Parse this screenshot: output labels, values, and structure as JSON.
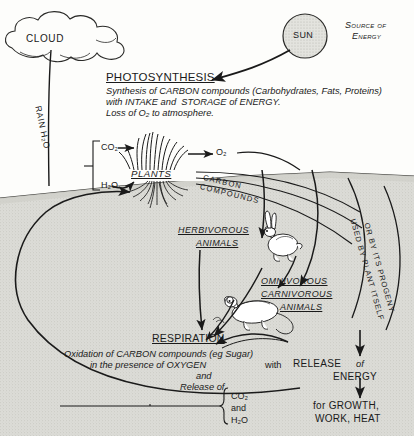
{
  "diagram": {
    "title_hidden_top": "",
    "background_color": "#fdfdfb",
    "ground_color": "#d9d9d4",
    "ink_color": "#1a1a1a"
  },
  "sky": {
    "cloud_label": "CLOUD",
    "sun_label": "SUN",
    "sun_caption_line1": "Source of",
    "sun_caption_line2": "Energy",
    "rain_label": "RAIN H₂O"
  },
  "photosynthesis": {
    "heading": "PHOTOSYNTHESIS",
    "line1": "Synthesis of CARBON compounds (Carbohydrates, Fats, Proteins)",
    "line2": "with INTAKE and  STORAGE of ENERGY.",
    "line3": "Loss of O₂ to atmosphere."
  },
  "plants": {
    "input_co2": "CO₂",
    "input_h2o": "H₂O",
    "output_o2": "O₂",
    "label": "PLANTS",
    "flow_label_line1": "CARBON",
    "flow_label_line2": "COMPOUNDS"
  },
  "consumers": {
    "herbivores_line1": "HERBIVOROUS",
    "herbivores_line2": "ANIMALS",
    "omnivores_line1": "OMNIVOROUS",
    "omnivores_line2": "CARNIVOROUS",
    "omnivores_line3": "ANIMALS",
    "plant_use_line1": "USED BY PLANT ITSELF",
    "plant_use_line2": "OR BY ITS PROGENY"
  },
  "respiration": {
    "heading": "RESPIRATION",
    "line1": "Oxidation of CARBON compounds (eg Sugar)",
    "line2_a": "in the presence of OXYGEN",
    "line2_b": "with",
    "line3": "and",
    "line4": "Release of",
    "brace_item1": "CO₂",
    "brace_item2": "and",
    "brace_item3": "H₂O"
  },
  "energy": {
    "release_label": "RELEASE",
    "release_of": "of",
    "energy_label": "ENERGY",
    "uses_line1": "for GROWTH,",
    "uses_line2": "WORK, HEAT"
  },
  "icons": {
    "cloud": "cloud-icon",
    "sun": "sun-icon",
    "grass": "grass-tuft-icon",
    "roots": "plant-roots-icon",
    "rabbit": "rabbit-icon",
    "rat": "rat-icon"
  }
}
